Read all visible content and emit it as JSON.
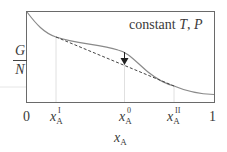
{
  "diagram": {
    "annotation": "constant T, P",
    "annotation_parts": {
      "prefix": "constant ",
      "T": "T",
      "sep": ", ",
      "P": "P"
    },
    "y_axis_label": {
      "numerator": "G",
      "denominator": "N"
    },
    "x_axis_label": {
      "var": "x",
      "sub": "A"
    },
    "x_ticks": [
      {
        "label": "0"
      },
      {
        "var": "x",
        "sub": "A",
        "sup": "I"
      },
      {
        "var": "x",
        "sub": "A",
        "sup": "0"
      },
      {
        "var": "x",
        "sub": "A",
        "sup": "II"
      },
      {
        "label": "1"
      }
    ],
    "elements": {
      "curve": "free energy curve G/N vs x_A (solid, gray)",
      "tangent": "common tangent line (dashed) between x_A^I and x_A^II",
      "arrow": "downward arrow at x_A^0 from curve to tangent"
    },
    "colors": {
      "curve": "#8a8a8a",
      "frame": "#555555",
      "dashed": "#444444",
      "guides": "#d0d0d0"
    }
  }
}
